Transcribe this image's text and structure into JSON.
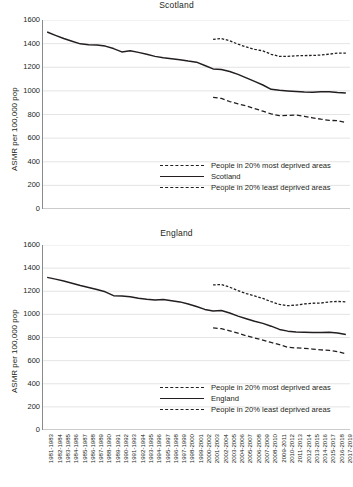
{
  "figure": {
    "background": "#ffffff",
    "ink": "#231f20",
    "gridline_color": "#d9d9d9",
    "axis_color": "#8a8a8a"
  },
  "chart_data": [
    {
      "type": "line",
      "title": "Scotland",
      "xlabel": "",
      "ylabel": "ASMR per 100,000 pop",
      "ylim": [
        0,
        1600
      ],
      "ytick_step": 200,
      "yticks": [
        0,
        200,
        400,
        600,
        800,
        1000,
        1200,
        1400,
        1600
      ],
      "grid": true,
      "legend_position": "inside lower right",
      "categories": [
        "1981-1983",
        "1982-1984",
        "1983-1985",
        "1984-1986",
        "1985-1987",
        "1986-1988",
        "1987-1989",
        "1988-1990",
        "1989-1991",
        "1990-1992",
        "1991-1993",
        "1992-1994",
        "1993-1995",
        "1994-1996",
        "1995-1997",
        "1996-1998",
        "1997-1999",
        "1998-2000",
        "1999-2001",
        "2000-2002",
        "2001-2003",
        "2002-2004",
        "2003-2005",
        "2004-2006",
        "2005-2007",
        "2006-2008",
        "2007-2009",
        "2008-2010",
        "2009-2011",
        "2010-2012",
        "2011-2013",
        "2012-2014",
        "2013-2015",
        "2014-2016",
        "2015-2017",
        "2016-2018",
        "2017-2019"
      ],
      "series": [
        {
          "name": "People in 20% most deprived areas",
          "style": "dotted",
          "values": [
            null,
            null,
            null,
            null,
            null,
            null,
            null,
            null,
            null,
            null,
            null,
            null,
            null,
            null,
            null,
            null,
            null,
            null,
            null,
            null,
            1436,
            1443,
            1425,
            1395,
            1372,
            1352,
            1339,
            1310,
            1292,
            1292,
            1297,
            1299,
            1300,
            1303,
            1311,
            1320,
            1320
          ]
        },
        {
          "name": "Scotland",
          "style": "solid",
          "values": [
            1498,
            1470,
            1443,
            1420,
            1398,
            1390,
            1389,
            1379,
            1358,
            1330,
            1340,
            1326,
            1310,
            1292,
            1280,
            1272,
            1264,
            1252,
            1243,
            1215,
            1186,
            1181,
            1164,
            1140,
            1110,
            1080,
            1050,
            1013,
            1005,
            999,
            994,
            990,
            988,
            992,
            993,
            987,
            983
          ]
        },
        {
          "name": "People in 20% least deprived areas",
          "style": "dashed",
          "values": [
            null,
            null,
            null,
            null,
            null,
            null,
            null,
            null,
            null,
            null,
            null,
            null,
            null,
            null,
            null,
            null,
            null,
            null,
            null,
            null,
            945,
            936,
            910,
            890,
            872,
            850,
            828,
            805,
            790,
            793,
            795,
            785,
            772,
            760,
            750,
            748,
            733
          ]
        }
      ]
    },
    {
      "type": "line",
      "title": "England",
      "xlabel": "",
      "ylabel": "ASMR per 100,000 pop",
      "ylim": [
        0,
        1600
      ],
      "ytick_step": 200,
      "yticks": [
        0,
        200,
        400,
        600,
        800,
        1000,
        1200,
        1400,
        1600
      ],
      "grid": true,
      "legend_position": "inside lower right",
      "categories": [
        "1981-1983",
        "1982-1984",
        "1983-1985",
        "1984-1986",
        "1985-1987",
        "1986-1988",
        "1987-1989",
        "1988-1990",
        "1989-1991",
        "1990-1992",
        "1991-1993",
        "1992-1994",
        "1993-1995",
        "1994-1996",
        "1995-1997",
        "1996-1998",
        "1997-1999",
        "1998-2000",
        "1999-2001",
        "2000-2002",
        "2001-2003",
        "2002-2004",
        "2003-2005",
        "2004-2006",
        "2005-2007",
        "2006-2008",
        "2007-2009",
        "2008-2010",
        "2009-2011",
        "2010-2012",
        "2011-2013",
        "2012-2014",
        "2013-2015",
        "2014-2016",
        "2015-2017",
        "2016-2018",
        "2017-2019"
      ],
      "series": [
        {
          "name": "People in 20% most deprived areas",
          "style": "dotted",
          "values": [
            null,
            null,
            null,
            null,
            null,
            null,
            null,
            null,
            null,
            null,
            null,
            null,
            null,
            null,
            null,
            null,
            null,
            null,
            null,
            null,
            1255,
            1258,
            1235,
            1205,
            1180,
            1160,
            1138,
            1110,
            1086,
            1075,
            1080,
            1090,
            1096,
            1098,
            1108,
            1112,
            1108
          ]
        },
        {
          "name": "England",
          "style": "solid",
          "values": [
            1320,
            1305,
            1288,
            1270,
            1250,
            1232,
            1215,
            1195,
            1162,
            1160,
            1152,
            1140,
            1130,
            1125,
            1128,
            1118,
            1108,
            1090,
            1068,
            1043,
            1030,
            1033,
            1012,
            985,
            962,
            940,
            922,
            898,
            870,
            855,
            848,
            845,
            843,
            844,
            845,
            838,
            825
          ]
        },
        {
          "name": "People in 20% least deprived areas",
          "style": "dashed",
          "values": [
            null,
            null,
            null,
            null,
            null,
            null,
            null,
            null,
            null,
            null,
            null,
            null,
            null,
            null,
            null,
            null,
            null,
            null,
            null,
            null,
            884,
            876,
            858,
            838,
            815,
            795,
            778,
            757,
            738,
            715,
            710,
            706,
            700,
            693,
            688,
            678,
            660
          ]
        }
      ]
    }
  ],
  "panels": {
    "scotland": {
      "title": "Scotland",
      "ylabel": "ASMR per 100,000 pop",
      "legend": [
        {
          "label": "People in 20% most deprived areas",
          "style": "dotted"
        },
        {
          "label": "Scotland",
          "style": "solid"
        },
        {
          "label": "People in 20% least deprived areas",
          "style": "dashed"
        }
      ]
    },
    "england": {
      "title": "England",
      "ylabel": "ASMR per 100,000 pop",
      "legend": [
        {
          "label": "People in 20% most deprived areas",
          "style": "dotted"
        },
        {
          "label": "England",
          "style": "solid"
        },
        {
          "label": "People in 20% least deprived areas",
          "style": "dashed"
        }
      ]
    }
  }
}
